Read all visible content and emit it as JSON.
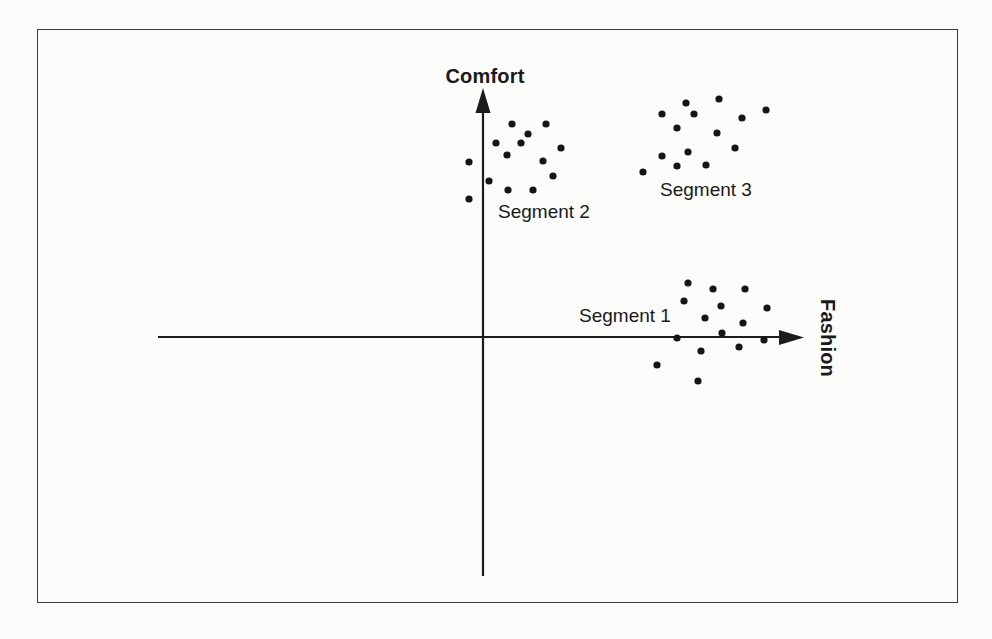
{
  "figure": {
    "background": "#fcfcfb",
    "border_color": "#3a3a3a",
    "axis_color": "#1c1c1c"
  },
  "labels": {
    "y_axis": "Comfort",
    "x_axis": "Fashion",
    "segment1": "Segment 1",
    "segment2": "Segment 2",
    "segment3": "Segment 3"
  },
  "chart_data": {
    "type": "scatter",
    "title": "",
    "xlabel": "Fashion",
    "ylabel": "Comfort",
    "legend_position": "none",
    "grid": false,
    "axis_ticks": "none (conceptual perceptual map, unlabeled scales)",
    "point_color": "#151515",
    "point_radius_px": 3.6,
    "axes_px": {
      "origin": [
        483,
        337
      ],
      "x_line": [
        [
          158,
          337
        ],
        [
          790,
          337
        ]
      ],
      "x_arrow_tip": [
        804,
        337
      ],
      "y_line": [
        [
          483,
          104
        ],
        [
          483,
          576
        ]
      ],
      "y_arrow_tip": [
        483,
        88
      ]
    },
    "series": [
      {
        "name": "Segment 1",
        "label_center_px": [
          625,
          316
        ],
        "points_px": [
          [
            688,
            283
          ],
          [
            713,
            289
          ],
          [
            745,
            289
          ],
          [
            684,
            301
          ],
          [
            721,
            306
          ],
          [
            767,
            308
          ],
          [
            705,
            318
          ],
          [
            743,
            323
          ],
          [
            677,
            338
          ],
          [
            722,
            333
          ],
          [
            764,
            340
          ],
          [
            701,
            351
          ],
          [
            739,
            347
          ],
          [
            657,
            365
          ],
          [
            698,
            381
          ]
        ]
      },
      {
        "name": "Segment 2",
        "label_center_px": [
          544,
          212
        ],
        "points_px": [
          [
            512,
            124
          ],
          [
            546,
            124
          ],
          [
            528,
            134
          ],
          [
            496,
            143
          ],
          [
            521,
            143
          ],
          [
            561,
            148
          ],
          [
            507,
            155
          ],
          [
            543,
            161
          ],
          [
            469,
            162
          ],
          [
            489,
            181
          ],
          [
            553,
            176
          ],
          [
            508,
            190
          ],
          [
            533,
            190
          ],
          [
            469,
            199
          ]
        ]
      },
      {
        "name": "Segment 3",
        "label_center_px": [
          706,
          190
        ],
        "points_px": [
          [
            686,
            103
          ],
          [
            719,
            99
          ],
          [
            662,
            114
          ],
          [
            694,
            114
          ],
          [
            766,
            110
          ],
          [
            742,
            118
          ],
          [
            677,
            128
          ],
          [
            717,
            133
          ],
          [
            735,
            148
          ],
          [
            688,
            152
          ],
          [
            662,
            156
          ],
          [
            677,
            166
          ],
          [
            706,
            165
          ],
          [
            643,
            172
          ]
        ]
      }
    ]
  }
}
